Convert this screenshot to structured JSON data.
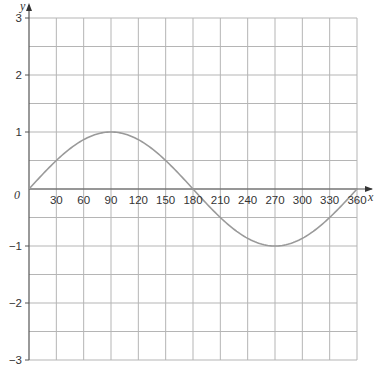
{
  "chart_data": {
    "type": "line",
    "title": "",
    "xlabel": "x",
    "ylabel": "y",
    "origin_label": "0",
    "xlim": [
      0,
      360
    ],
    "ylim": [
      -3,
      3
    ],
    "grid": true,
    "x_ticks": [
      30,
      60,
      90,
      120,
      150,
      180,
      210,
      240,
      270,
      300,
      330,
      360
    ],
    "x_tick_labels": [
      "30",
      "60",
      "90",
      "120",
      "150",
      "180",
      "210",
      "240",
      "270",
      "300",
      "330",
      "360"
    ],
    "y_ticks": [
      -3,
      -2,
      -1,
      1,
      2,
      3
    ],
    "y_tick_labels": [
      "−3",
      "−2",
      "−1",
      "1",
      "2",
      "3"
    ],
    "series": [
      {
        "name": "y = sin x",
        "color": "#9a9a9a",
        "x": [
          0,
          30,
          60,
          90,
          120,
          150,
          180,
          210,
          240,
          270,
          300,
          330,
          360
        ],
        "values": [
          0,
          0.5,
          0.866,
          1,
          0.866,
          0.5,
          0,
          -0.5,
          -0.866,
          -1,
          -0.866,
          -0.5,
          0
        ]
      }
    ],
    "colors": {
      "grid": "#b5b5b5",
      "axis": "#555555",
      "curve": "#9a9a9a"
    }
  }
}
